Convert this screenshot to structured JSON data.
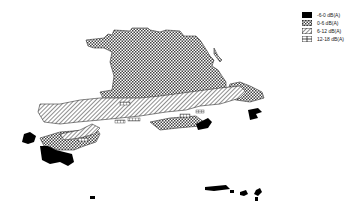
{
  "map": {
    "type": "noise-difference contour map",
    "background": "#ffffff"
  },
  "legend": {
    "items": [
      {
        "label": "-6-0 dB(A)",
        "pattern": "solid-black",
        "color": "#000000"
      },
      {
        "label": "0-6 dB(A)",
        "pattern": "checkerboard",
        "color": "#333333"
      },
      {
        "label": "6-12 dB(A)",
        "pattern": "diagonal-hatch",
        "color": "#333333"
      },
      {
        "label": "12-18 dB(A)",
        "pattern": "grid",
        "color": "#333333"
      }
    ]
  }
}
